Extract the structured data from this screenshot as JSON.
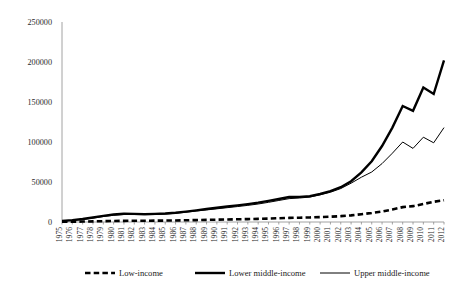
{
  "chart_data": {
    "type": "line",
    "title": "",
    "subtitle": "",
    "xlabel": "",
    "ylabel": "",
    "ylim": [
      0,
      250000
    ],
    "ytick_values": [
      0,
      50000,
      100000,
      150000,
      200000,
      250000
    ],
    "ytick_labels": [
      "0",
      "50000",
      "100000",
      "150000",
      "200000",
      "250000"
    ],
    "grid": false,
    "legend_position": "bottom-center",
    "x": [
      1975,
      1976,
      1977,
      1978,
      1979,
      1980,
      1981,
      1982,
      1983,
      1984,
      1985,
      1986,
      1987,
      1988,
      1989,
      1990,
      1991,
      1992,
      1993,
      1994,
      1995,
      1996,
      1997,
      1998,
      1999,
      2000,
      2001,
      2002,
      2003,
      2004,
      2005,
      2006,
      2007,
      2008,
      2009,
      2010,
      2011,
      2012
    ],
    "xtick_labels": [
      "1975",
      "1976",
      "1977",
      "1978",
      "1979",
      "1980",
      "1981",
      "1982",
      "1983",
      "1984",
      "1985",
      "1986",
      "1987",
      "1988",
      "1989",
      "1990",
      "1991",
      "1992",
      "1993",
      "1994",
      "1995",
      "1996",
      "1997",
      "1998",
      "1999",
      "2000",
      "2001",
      "2002",
      "2003",
      "2004",
      "2005",
      "2006",
      "2007",
      "2008",
      "2009",
      "2010",
      "2011",
      "2012"
    ],
    "series": [
      {
        "name": "Low-income",
        "style": "dashed-thick",
        "color": "#000000",
        "values": [
          300,
          420,
          560,
          760,
          1000,
          1250,
          1450,
          1550,
          1600,
          1700,
          1800,
          1950,
          2150,
          2400,
          2650,
          2900,
          3150,
          3400,
          3650,
          3950,
          4300,
          4700,
          5100,
          5400,
          5700,
          6100,
          6600,
          7300,
          8300,
          9700,
          11300,
          13200,
          15600,
          18600,
          19800,
          22500,
          25300,
          27200
        ]
      },
      {
        "name": "Lower middle-income",
        "style": "solid-thick",
        "color": "#000000",
        "values": [
          1400,
          2400,
          3800,
          5600,
          7600,
          9300,
          10400,
          10200,
          9800,
          10100,
          10600,
          11600,
          13000,
          14600,
          16200,
          17800,
          19300,
          20800,
          22400,
          24200,
          26400,
          28800,
          31200,
          31400,
          32200,
          35000,
          38500,
          43500,
          51000,
          62000,
          76000,
          95000,
          118000,
          145000,
          139000,
          168000,
          160000,
          202000
        ]
      },
      {
        "name": "Upper middle-income",
        "style": "solid-thin",
        "color": "#000000",
        "values": [
          1100,
          2000,
          3200,
          4900,
          6800,
          8400,
          9400,
          9300,
          9000,
          9300,
          9900,
          10900,
          12200,
          13700,
          15100,
          16500,
          17900,
          19300,
          20800,
          22500,
          24600,
          26900,
          29200,
          30000,
          31200,
          34000,
          37200,
          41800,
          48500,
          56000,
          62500,
          73000,
          86000,
          100000,
          92000,
          106000,
          99000,
          118000
        ]
      }
    ]
  },
  "legend": {
    "items": [
      {
        "label": "Low-income"
      },
      {
        "label": "Lower middle-income"
      },
      {
        "label": "Upper middle-income"
      }
    ]
  }
}
